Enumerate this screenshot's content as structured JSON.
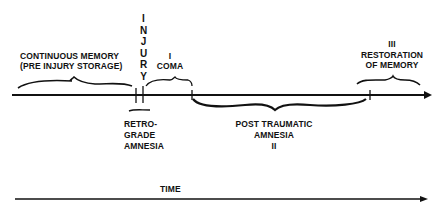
{
  "diagram": {
    "event": {
      "label": "INJURY",
      "letters": [
        "I",
        "N",
        "J",
        "U",
        "R",
        "Y"
      ]
    },
    "phases": {
      "pre_injury": {
        "line1": "CONTINUOUS MEMORY",
        "line2": "(PRE INJURY STORAGE)"
      },
      "coma": {
        "numeral": "I",
        "label": "COMA"
      },
      "retrograde": {
        "line1": "RETRO-",
        "line2": "GRADE",
        "line3": "AMNESIA"
      },
      "post_traumatic": {
        "line1": "POST TRAUMATIC",
        "line2": "AMNESIA",
        "numeral": "II"
      },
      "restoration": {
        "numeral": "III",
        "line1": "RESTORATION",
        "line2": "OF MEMORY"
      }
    },
    "time_axis": {
      "label": "TIME"
    },
    "colors": {
      "ink": "#111111",
      "background": "#ffffff"
    }
  }
}
